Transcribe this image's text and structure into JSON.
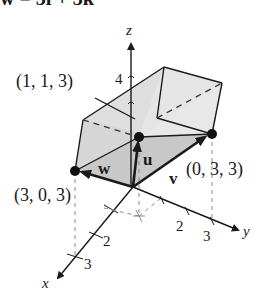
{
  "title": {
    "text": "w = 3i + 3k",
    "cropped": true
  },
  "axes": {
    "x": {
      "label": "x",
      "ticks": [
        "2",
        "3"
      ]
    },
    "y": {
      "label": "y",
      "ticks": [
        "2",
        "3"
      ]
    },
    "z": {
      "label": "z",
      "ticks": [
        "4"
      ]
    }
  },
  "points": [
    {
      "id": "p113",
      "label": "(1, 1, 3)"
    },
    {
      "id": "p033",
      "label": "(0, 3, 3)"
    },
    {
      "id": "p303",
      "label": "(3, 0, 3)"
    }
  ],
  "vectors": [
    {
      "id": "u",
      "label": "u"
    },
    {
      "id": "v",
      "label": "v"
    },
    {
      "id": "w",
      "label": "w"
    }
  ],
  "colors": {
    "line": "#1a1a1a",
    "face_light": "#e6e6e6",
    "face_mid": "#d2d2d2",
    "face_dark": "#bdbdbd",
    "dashed": "#333333",
    "guide": "#8a8a8a"
  }
}
